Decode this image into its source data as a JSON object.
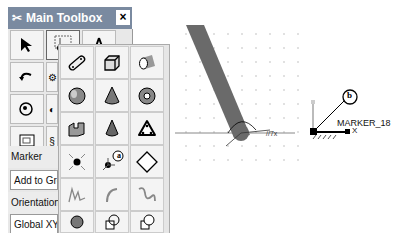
{
  "toolbox": {
    "title": "Main Toolbox",
    "close_label": "×",
    "tools": [
      {
        "name": "select-arrow-icon"
      },
      {
        "name": "marker-tool-icon"
      },
      {
        "name": "compass-icon"
      },
      {
        "name": "undo-icon"
      },
      {
        "name": "link-icon"
      },
      {
        "name": "render-icon"
      },
      {
        "name": "spring-icon"
      },
      {
        "name": "view-icon"
      },
      {
        "name": "plot-icon"
      }
    ],
    "flyout_tools": [
      {
        "name": "link-geometry-icon"
      },
      {
        "name": "box-icon"
      },
      {
        "name": "cylinder-icon"
      },
      {
        "name": "sphere-icon"
      },
      {
        "name": "cone-icon"
      },
      {
        "name": "torus-icon"
      },
      {
        "name": "extrusion-icon"
      },
      {
        "name": "revolution-icon"
      },
      {
        "name": "plate-icon"
      },
      {
        "name": "point-icon"
      },
      {
        "name": "marker-icon"
      },
      {
        "name": "plane-icon"
      },
      {
        "name": "polyline-icon"
      },
      {
        "name": "arc-icon"
      },
      {
        "name": "spline-icon"
      },
      {
        "name": "boolean-union-icon"
      },
      {
        "name": "boolean-intersect-icon"
      },
      {
        "name": "boolean-subtract-icon"
      }
    ],
    "marker_label": "Marker",
    "marker_option": "Add to Grou",
    "orientation_label": "Orientation",
    "orientation_option": "Global XY",
    "callout_a": "a"
  },
  "canvas": {
    "marker_name": "MARKER_18",
    "axis_x": "X",
    "callout_b": "b",
    "link_color": "#6a6a6a",
    "grid_color": "#bbbbbb"
  }
}
